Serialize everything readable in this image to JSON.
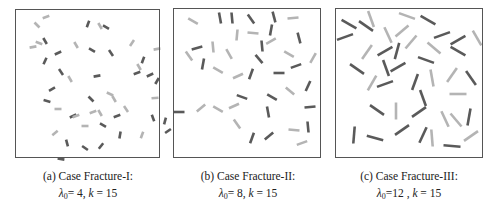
{
  "figure": {
    "panels": [
      {
        "id": "a",
        "caption_title": "(a) Case Fracture-I:",
        "lambda_symbol": "λ",
        "lambda_sub": "0",
        "lambda_value": "= 4",
        "k_symbol": "k",
        "k_value": "= 15",
        "box": {
          "x": 15,
          "y": 9,
          "w": 145,
          "h": 149
        },
        "seg_len": 7,
        "segments": [
          [
            31,
            8,
            -20,
            "l"
          ],
          [
            22,
            16,
            45,
            "l"
          ],
          [
            73,
            15,
            -70,
            "d"
          ],
          [
            85,
            17,
            60,
            "l"
          ],
          [
            91,
            18,
            30,
            "d"
          ],
          [
            18,
            38,
            -10,
            "l"
          ],
          [
            24,
            34,
            20,
            "l"
          ],
          [
            30,
            32,
            60,
            "d"
          ],
          [
            43,
            44,
            -25,
            "d"
          ],
          [
            61,
            36,
            60,
            "l"
          ],
          [
            77,
            41,
            30,
            "d"
          ],
          [
            96,
            44,
            55,
            "d"
          ],
          [
            117,
            34,
            -55,
            "l"
          ],
          [
            142,
            40,
            -10,
            "l"
          ],
          [
            128,
            51,
            -70,
            "d"
          ],
          [
            124,
            58,
            60,
            "l"
          ],
          [
            122,
            64,
            -20,
            "d"
          ],
          [
            135,
            66,
            -25,
            "d"
          ],
          [
            142,
            72,
            -60,
            "d"
          ],
          [
            30,
            52,
            -65,
            "d"
          ],
          [
            46,
            63,
            55,
            "d"
          ],
          [
            55,
            70,
            60,
            "l"
          ],
          [
            82,
            67,
            -10,
            "d"
          ],
          [
            37,
            80,
            -30,
            "d"
          ],
          [
            32,
            92,
            15,
            "d"
          ],
          [
            76,
            90,
            45,
            "d"
          ],
          [
            95,
            85,
            25,
            "l"
          ],
          [
            99,
            90,
            60,
            "l"
          ],
          [
            140,
            89,
            -5,
            "l"
          ],
          [
            43,
            100,
            0,
            "l"
          ],
          [
            58,
            107,
            -25,
            "d"
          ],
          [
            78,
            103,
            -20,
            "l"
          ],
          [
            85,
            104,
            60,
            "l"
          ],
          [
            102,
            107,
            -20,
            "d"
          ],
          [
            111,
            100,
            55,
            "l"
          ],
          [
            138,
            109,
            70,
            "d"
          ],
          [
            150,
            112,
            -75,
            "d"
          ],
          [
            40,
            124,
            -40,
            "l"
          ],
          [
            70,
            117,
            0,
            "l"
          ],
          [
            88,
            116,
            30,
            "d"
          ],
          [
            105,
            126,
            -80,
            "d"
          ],
          [
            127,
            126,
            -70,
            "l"
          ],
          [
            153,
            122,
            -35,
            "d"
          ],
          [
            52,
            134,
            75,
            "d"
          ],
          [
            70,
            139,
            35,
            "d"
          ],
          [
            86,
            137,
            -50,
            "d"
          ],
          [
            46,
            150,
            10,
            "d"
          ],
          [
            61,
            107,
            -20,
            "l"
          ]
        ]
      },
      {
        "id": "b",
        "caption_title": "(b) Case Fracture-II:",
        "lambda_symbol": "λ",
        "lambda_sub": "0",
        "lambda_value": "= 8",
        "k_symbol": "k",
        "k_value": "= 15",
        "box": {
          "x": 173,
          "y": 8,
          "w": 148,
          "h": 150
        },
        "seg_len": 11,
        "segments": [
          [
            20,
            13,
            30,
            "l"
          ],
          [
            47,
            10,
            80,
            "d"
          ],
          [
            59,
            10,
            85,
            "d"
          ],
          [
            78,
            11,
            55,
            "d"
          ],
          [
            101,
            9,
            75,
            "d"
          ],
          [
            120,
            10,
            -5,
            "l"
          ],
          [
            64,
            27,
            -85,
            "l"
          ],
          [
            80,
            25,
            5,
            "l"
          ],
          [
            98,
            22,
            -80,
            "d"
          ],
          [
            126,
            30,
            75,
            "d"
          ],
          [
            98,
            33,
            -30,
            "l"
          ],
          [
            24,
            40,
            -15,
            "d"
          ],
          [
            40,
            39,
            85,
            "l"
          ],
          [
            16,
            48,
            55,
            "l"
          ],
          [
            56,
            46,
            60,
            "l"
          ],
          [
            89,
            38,
            85,
            "d"
          ],
          [
            86,
            51,
            50,
            "d"
          ],
          [
            116,
            46,
            30,
            "l"
          ],
          [
            140,
            50,
            -60,
            "l"
          ],
          [
            30,
            56,
            -80,
            "d"
          ],
          [
            45,
            62,
            30,
            "l"
          ],
          [
            65,
            68,
            -25,
            "l"
          ],
          [
            78,
            66,
            -70,
            "d"
          ],
          [
            106,
            65,
            0,
            "d"
          ],
          [
            123,
            58,
            -20,
            "d"
          ],
          [
            135,
            78,
            -65,
            "d"
          ],
          [
            117,
            83,
            40,
            "l"
          ],
          [
            69,
            89,
            20,
            "d"
          ],
          [
            99,
            89,
            30,
            "d"
          ],
          [
            6,
            104,
            0,
            "d"
          ],
          [
            28,
            100,
            -40,
            "l"
          ],
          [
            45,
            101,
            30,
            "l"
          ],
          [
            61,
            98,
            -25,
            "l"
          ],
          [
            95,
            104,
            80,
            "d"
          ],
          [
            137,
            99,
            -5,
            "d"
          ],
          [
            64,
            116,
            55,
            "l"
          ],
          [
            121,
            122,
            5,
            "l"
          ],
          [
            135,
            119,
            85,
            "d"
          ],
          [
            79,
            130,
            -70,
            "d"
          ],
          [
            96,
            128,
            -40,
            "d"
          ],
          [
            129,
            135,
            -20,
            "l"
          ]
        ]
      },
      {
        "id": "c",
        "caption_title": "(c) Case Fracture-III:",
        "lambda_symbol": "λ",
        "lambda_sub": "0",
        "lambda_value": "=12",
        "k_symbol": "k",
        "k_value": "= 15",
        "box": {
          "x": 335,
          "y": 8,
          "w": 148,
          "h": 150
        },
        "seg_len": 17,
        "segments": [
          [
            14,
            16,
            30,
            "d"
          ],
          [
            31,
            18,
            35,
            "d"
          ],
          [
            36,
            11,
            70,
            "l"
          ],
          [
            72,
            8,
            20,
            "l"
          ],
          [
            93,
            12,
            30,
            "d"
          ],
          [
            10,
            29,
            -20,
            "d"
          ],
          [
            53,
            27,
            65,
            "l"
          ],
          [
            67,
            23,
            -40,
            "l"
          ],
          [
            50,
            43,
            -30,
            "d"
          ],
          [
            62,
            43,
            -75,
            "d"
          ],
          [
            76,
            34,
            -50,
            "l"
          ],
          [
            99,
            40,
            40,
            "l"
          ],
          [
            107,
            27,
            -20,
            "d"
          ],
          [
            123,
            32,
            -30,
            "d"
          ],
          [
            123,
            43,
            30,
            "d"
          ],
          [
            142,
            30,
            60,
            "l"
          ],
          [
            32,
            44,
            -55,
            "l"
          ],
          [
            22,
            61,
            35,
            "d"
          ],
          [
            51,
            60,
            70,
            "d"
          ],
          [
            63,
            59,
            -30,
            "d"
          ],
          [
            91,
            52,
            20,
            "d"
          ],
          [
            37,
            75,
            -60,
            "l"
          ],
          [
            50,
            76,
            -20,
            "d"
          ],
          [
            80,
            74,
            -70,
            "d"
          ],
          [
            88,
            90,
            70,
            "d"
          ],
          [
            97,
            70,
            80,
            "l"
          ],
          [
            117,
            67,
            -55,
            "l"
          ],
          [
            136,
            70,
            55,
            "d"
          ],
          [
            123,
            86,
            0,
            "l"
          ],
          [
            42,
            102,
            35,
            "d"
          ],
          [
            61,
            103,
            90,
            "l"
          ],
          [
            84,
            104,
            -35,
            "d"
          ],
          [
            110,
            111,
            65,
            "l"
          ],
          [
            121,
            112,
            50,
            "l"
          ],
          [
            134,
            109,
            -80,
            "d"
          ],
          [
            19,
            127,
            -85,
            "d"
          ],
          [
            40,
            130,
            15,
            "d"
          ],
          [
            67,
            122,
            -35,
            "d"
          ],
          [
            88,
            127,
            -65,
            "d"
          ],
          [
            97,
            130,
            85,
            "l"
          ],
          [
            117,
            138,
            5,
            "d"
          ],
          [
            136,
            128,
            -35,
            "l"
          ]
        ]
      }
    ]
  },
  "colors": {
    "dark": "#5a5a5a",
    "light": "#b4b4b4",
    "frame": "#555555"
  }
}
